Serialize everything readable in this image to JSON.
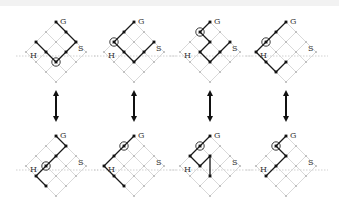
{
  "labels": {
    "start": "S",
    "goal": "G",
    "hit": "H"
  },
  "colors": {
    "grid": "#cfcfcf",
    "node": "#b8b8b8",
    "path": "#1a1a1a",
    "axis": "#bdbdbd"
  },
  "lattice": {
    "cells": 3,
    "d": 10
  },
  "panels": [
    {
      "row": "top",
      "top": [
        55,
        22
      ],
      "path": [
        [
          0,
          3
        ],
        [
          0,
          2
        ],
        [
          0,
          1
        ],
        [
          1,
          1
        ],
        [
          2,
          1
        ],
        [
          2,
          2
        ],
        [
          2,
          3
        ]
      ],
      "ring": [
        2,
        1
      ]
    },
    {
      "row": "top",
      "top": [
        168,
        22
      ],
      "path": [
        [
          0,
          3
        ],
        [
          1,
          3
        ],
        [
          2,
          3
        ],
        [
          2,
          2
        ],
        [
          2,
          1
        ],
        [
          1,
          1
        ],
        [
          0,
          1
        ]
      ],
      "ring": [
        2,
        3
      ]
    },
    {
      "row": "top",
      "top": [
        222,
        22
      ],
      "path": [
        [
          0,
          3
        ],
        [
          1,
          3
        ],
        [
          1,
          2
        ],
        [
          2,
          2
        ],
        [
          2,
          1
        ],
        [
          1,
          1
        ],
        [
          0,
          1
        ]
      ],
      "ring": [
        1,
        3
      ]
    },
    {
      "row": "top",
      "top": [
        283,
        22
      ],
      "path": [
        [
          0,
          3
        ],
        [
          1,
          3
        ],
        [
          2,
          3
        ],
        [
          3,
          3
        ],
        [
          3,
          2
        ],
        [
          3,
          1
        ],
        [
          2,
          1
        ]
      ],
      "ring": [
        2,
        3
      ]
    },
    {
      "row": "bottom",
      "top": [
        55,
        136
      ],
      "path": [
        [
          0,
          3
        ],
        [
          0,
          2
        ],
        [
          1,
          2
        ],
        [
          2,
          2
        ],
        [
          3,
          2
        ],
        [
          3,
          1
        ]
      ],
      "ring": [
        2,
        2
      ]
    },
    {
      "row": "bottom",
      "top": [
        168,
        136
      ],
      "path": [
        [
          0,
          3
        ],
        [
          1,
          3
        ],
        [
          2,
          3
        ],
        [
          3,
          3
        ],
        [
          3,
          2
        ],
        [
          3,
          1
        ]
      ],
      "ring": [
        1,
        3
      ]
    },
    {
      "row": "bottom",
      "top": [
        222,
        136
      ],
      "path": [
        [
          0,
          3
        ],
        [
          1,
          3
        ],
        [
          2,
          3
        ],
        [
          2,
          2
        ],
        [
          1,
          2
        ],
        [
          2,
          1
        ]
      ],
      "ring": [
        1,
        3
      ]
    },
    {
      "row": "bottom",
      "top": [
        283,
        136
      ],
      "path": [
        [
          0,
          3
        ],
        [
          1,
          3
        ],
        [
          1,
          2
        ],
        [
          2,
          2
        ],
        [
          3,
          2
        ]
      ],
      "ring": [
        1,
        3
      ]
    }
  ],
  "arrows": [
    {
      "x": 56,
      "y1": 90,
      "y2": 122
    },
    {
      "x": 134,
      "y1": 90,
      "y2": 122
    },
    {
      "x": 210,
      "y1": 90,
      "y2": 122
    },
    {
      "x": 286,
      "y1": 90,
      "y2": 122
    }
  ]
}
